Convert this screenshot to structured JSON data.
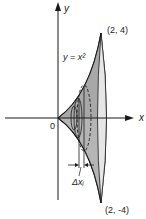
{
  "diagram": {
    "axis_labels": {
      "x": "x",
      "y": "y",
      "origin": "0"
    },
    "curve_label": "y = x²",
    "points": {
      "top": "(2, 4)",
      "bottom": "(2, -4)"
    },
    "slice_label": "Δxᵢ",
    "colors": {
      "outer_solid": "#d9d9d9",
      "inner_region": "#a9a9a9",
      "outline": "#1a1a1a",
      "background": "#ffffff"
    }
  }
}
